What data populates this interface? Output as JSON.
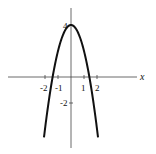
{
  "chart_data": {
    "type": "line",
    "title": "",
    "xlabel": "x",
    "ylabel": "",
    "function": "y = 4 - 2x^2",
    "x_ticks": [
      -2,
      -1,
      1,
      2
    ],
    "x_tick_labels": [
      "-2",
      "-1",
      "1",
      "2"
    ],
    "y_ticks": [
      4,
      -2
    ],
    "y_tick_labels": [
      "4",
      "-2"
    ],
    "xlim": [
      -5.2,
      5.2
    ],
    "ylim": [
      -5.2,
      5.5
    ],
    "grid": false,
    "series": [
      {
        "name": "parabola",
        "x": [
          -2.1,
          -2,
          -1.5,
          -1.414,
          -1,
          -0.5,
          0,
          0.5,
          1,
          1.414,
          1.5,
          2,
          2.1
        ],
        "y": [
          -4.82,
          -4,
          -0.5,
          0,
          2,
          3.5,
          4,
          3.5,
          2,
          0,
          -0.5,
          -4,
          -4.82
        ]
      }
    ]
  },
  "labels": {
    "x_axis": "x",
    "t_neg2": "-2",
    "t_neg1": "-1",
    "t_1": "1",
    "t_2": "2",
    "y_4": "4",
    "y_neg2": "-2"
  }
}
